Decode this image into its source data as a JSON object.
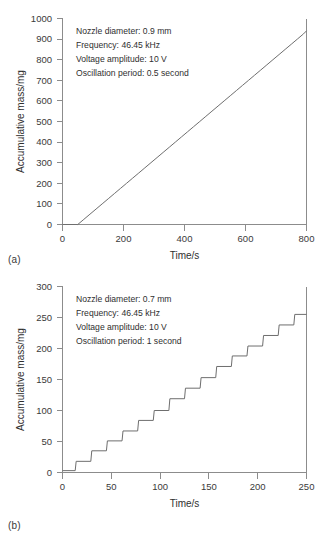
{
  "figure": {
    "panels": [
      {
        "id": "a",
        "panel_label": "(a)",
        "annotations": [
          "Nozzle diameter: 0.9 mm",
          "Frequency: 46.45 kHz",
          "Voltage amplitude: 10 V",
          "Oscillation period: 0.5 second"
        ]
      },
      {
        "id": "b",
        "panel_label": "(b)",
        "annotations": [
          "Nozzle diameter: 0.7 mm",
          "Frequency: 46.45 kHz",
          "Voltage amplitude: 10 V",
          "Oscillation period: 1 second"
        ]
      }
    ]
  },
  "chart_data": [
    {
      "type": "line",
      "subtype": "step",
      "panel": "(a)",
      "title": "",
      "xlabel": "Time/s",
      "ylabel": "Accumulative mass/mg",
      "xlim": [
        0,
        800
      ],
      "ylim": [
        0,
        1000
      ],
      "xticks": [
        0,
        200,
        400,
        600,
        800
      ],
      "yticks": [
        0,
        100,
        200,
        300,
        400,
        500,
        600,
        700,
        800,
        900,
        1000
      ],
      "xtick_labels": [
        "0",
        "200",
        "400",
        "600",
        "800"
      ],
      "ytick_labels": [
        "0",
        "100",
        "200",
        "300",
        "400",
        "500",
        "600",
        "700",
        "800",
        "900",
        "1000"
      ],
      "grid": false,
      "legend": null,
      "line_color": "#6e6e6e",
      "axis_color": "#8c8c8c",
      "annotations": [
        "Nozzle diameter: 0.9 mm",
        "Frequency: 46.45 kHz",
        "Voltage amplitude: 10 V",
        "Oscillation period: 0.5 second"
      ],
      "step_start_x": 50,
      "step_period_x": 20,
      "step_rise_y": 25,
      "final_x": 800,
      "final_y": 940,
      "x": [
        0,
        50,
        70,
        90,
        110,
        130,
        150,
        170,
        190,
        210,
        230,
        250,
        270,
        290,
        310,
        330,
        350,
        370,
        390,
        410,
        430,
        450,
        470,
        490,
        510,
        530,
        550,
        570,
        590,
        610,
        630,
        650,
        670,
        690,
        710,
        730,
        750,
        770,
        790,
        800
      ],
      "y": [
        0,
        0,
        25,
        50,
        75,
        100,
        125,
        150,
        175,
        200,
        225,
        250,
        275,
        300,
        325,
        350,
        375,
        400,
        425,
        450,
        475,
        500,
        525,
        550,
        575,
        600,
        625,
        650,
        675,
        700,
        725,
        750,
        775,
        800,
        825,
        850,
        875,
        900,
        925,
        940
      ]
    },
    {
      "type": "line",
      "subtype": "step",
      "panel": "(b)",
      "title": "",
      "xlabel": "Time/s",
      "ylabel": "Accumulative mass/mg",
      "xlim": [
        0,
        250
      ],
      "ylim": [
        0,
        300
      ],
      "xticks": [
        0,
        50,
        100,
        150,
        200,
        250
      ],
      "yticks": [
        0,
        50,
        100,
        150,
        200,
        250,
        300
      ],
      "xtick_labels": [
        "0",
        "50",
        "100",
        "150",
        "200",
        "250"
      ],
      "ytick_labels": [
        "0",
        "50",
        "100",
        "150",
        "200",
        "250",
        "300"
      ],
      "grid": false,
      "legend": null,
      "line_color": "#6e6e6e",
      "axis_color": "#8c8c8c",
      "annotations": [
        "Nozzle diameter: 0.7 mm",
        "Frequency: 46.45 kHz",
        "Voltage amplitude: 10 V",
        "Oscillation period: 1 second"
      ],
      "step_start_x": 13,
      "step_period_x": 16,
      "step_rise_y": 17,
      "final_x": 250,
      "final_y": 255,
      "x": [
        0,
        13,
        14,
        29,
        30,
        45,
        46,
        61,
        62,
        77,
        78,
        93,
        94,
        109,
        110,
        125,
        126,
        141,
        142,
        157,
        158,
        173,
        174,
        189,
        190,
        205,
        206,
        221,
        222,
        237,
        238,
        250
      ],
      "y": [
        3,
        3,
        18,
        18,
        35,
        35,
        51,
        51,
        67,
        67,
        84,
        84,
        100,
        100,
        119,
        119,
        136,
        136,
        153,
        153,
        171,
        171,
        188,
        188,
        204,
        204,
        221,
        221,
        238,
        238,
        255,
        255
      ]
    }
  ]
}
